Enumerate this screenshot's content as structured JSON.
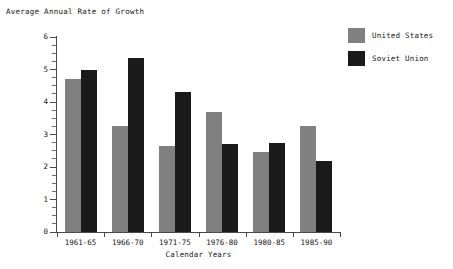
{
  "chart_data": {
    "type": "bar",
    "title": "Average Annual Rate of Growth",
    "xlabel": "Calendar Years",
    "ylabel": "",
    "categories": [
      "1961-65",
      "1966-70",
      "1971-75",
      "1976-80",
      "1980-85",
      "1985-90"
    ],
    "series": [
      {
        "name": "United States",
        "color": "#808080",
        "values": [
          4.7,
          3.25,
          2.65,
          3.7,
          2.45,
          3.25
        ]
      },
      {
        "name": "Soviet Union",
        "color": "#1a1a1a",
        "values": [
          5.0,
          5.35,
          4.3,
          2.7,
          2.75,
          2.2
        ]
      }
    ],
    "ylim": [
      0,
      6
    ],
    "yticks": [
      0,
      1,
      2,
      3,
      4,
      5,
      6
    ],
    "ytick_labels": [
      "0",
      "1",
      "2",
      "3",
      "4",
      "5",
      "6"
    ],
    "minor_tick_step": 0.25,
    "grid": false,
    "legend_position": "top-right"
  },
  "legend": {
    "entries": [
      {
        "label": "United States",
        "swatch": "#808080"
      },
      {
        "label": "Soviet Union",
        "swatch": "#1a1a1a"
      }
    ]
  }
}
